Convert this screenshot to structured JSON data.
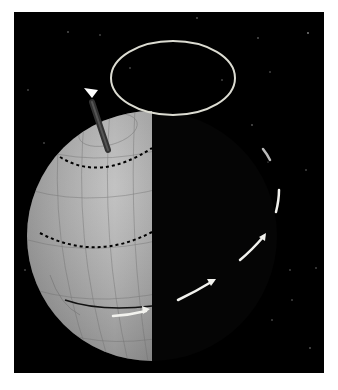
{
  "figure": {
    "background_color": "#ffffff",
    "panel": {
      "x": 14,
      "y": 12,
      "width": 310,
      "height": 361,
      "color": "#000000"
    },
    "globe": {
      "cx": 152,
      "cy": 236,
      "r": 125,
      "lit_color_light": "#bdbdbd",
      "lit_color_dark": "#5a5a5a",
      "terminator_x": 152
    },
    "precession_circle": {
      "cx": 173,
      "cy": 78,
      "rx": 62,
      "ry": 37,
      "color": "#d8d8d0"
    },
    "axis": {
      "x1": 108,
      "y1": 150,
      "x2": 92,
      "y2": 103,
      "color": "#2a2a2a"
    },
    "dashed_latitudes": [
      "tropic-of-cancer",
      "tropic-of-capricorn"
    ],
    "orbit_arrows": 4
  }
}
